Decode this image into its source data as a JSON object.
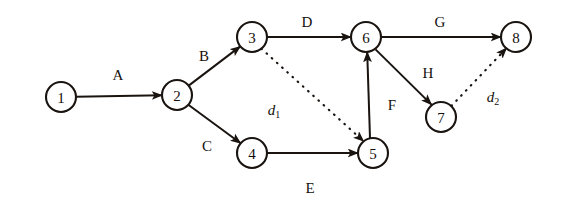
{
  "diagram": {
    "type": "directed-network",
    "canvas": {
      "width": 564,
      "height": 212
    },
    "colors": {
      "background": "#ffffff",
      "stroke": "#1a1410",
      "text": "#140f0c"
    },
    "nodes": [
      {
        "id": "1",
        "label": "1",
        "cx": 61,
        "cy": 97,
        "r": 15
      },
      {
        "id": "2",
        "label": "2",
        "cx": 177,
        "cy": 95,
        "r": 15
      },
      {
        "id": "3",
        "label": "3",
        "cx": 252,
        "cy": 37,
        "r": 15
      },
      {
        "id": "4",
        "label": "4",
        "cx": 252,
        "cy": 153,
        "r": 15
      },
      {
        "id": "5",
        "label": "5",
        "cx": 373,
        "cy": 153,
        "r": 15
      },
      {
        "id": "6",
        "label": "6",
        "cx": 366,
        "cy": 37,
        "r": 15
      },
      {
        "id": "7",
        "label": "7",
        "cx": 441,
        "cy": 117,
        "r": 15
      },
      {
        "id": "8",
        "label": "8",
        "cx": 516,
        "cy": 37,
        "r": 15
      }
    ],
    "edges": [
      {
        "id": "A",
        "label": "A",
        "from": "1",
        "to": "2",
        "style": "solid",
        "label_x": 118,
        "label_y": 75
      },
      {
        "id": "B",
        "label": "B",
        "from": "2",
        "to": "3",
        "style": "solid",
        "label_x": 204,
        "label_y": 56
      },
      {
        "id": "C",
        "label": "C",
        "from": "2",
        "to": "4",
        "style": "solid",
        "label_x": 207,
        "label_y": 146
      },
      {
        "id": "D",
        "label": "D",
        "from": "3",
        "to": "6",
        "style": "solid",
        "label_x": 307,
        "label_y": 22
      },
      {
        "id": "E",
        "label": "E",
        "from": "4",
        "to": "5",
        "style": "solid",
        "label_x": 310,
        "label_y": 188
      },
      {
        "id": "F",
        "label": "F",
        "from": "5",
        "to": "6",
        "style": "solid",
        "label_x": 392,
        "label_y": 105
      },
      {
        "id": "G",
        "label": "G",
        "from": "6",
        "to": "8",
        "style": "solid",
        "label_x": 440,
        "label_y": 22
      },
      {
        "id": "H",
        "label": "H",
        "from": "6",
        "to": "7",
        "style": "solid",
        "label_x": 428,
        "label_y": 73
      },
      {
        "id": "d1",
        "label": "d",
        "sub": "1",
        "from": "3",
        "to": "5",
        "style": "dotted",
        "label_x": 274,
        "label_y": 110
      },
      {
        "id": "d2",
        "label": "d",
        "sub": "2",
        "from": "7",
        "to": "8",
        "style": "dotted",
        "label_x": 493,
        "label_y": 97
      }
    ]
  }
}
